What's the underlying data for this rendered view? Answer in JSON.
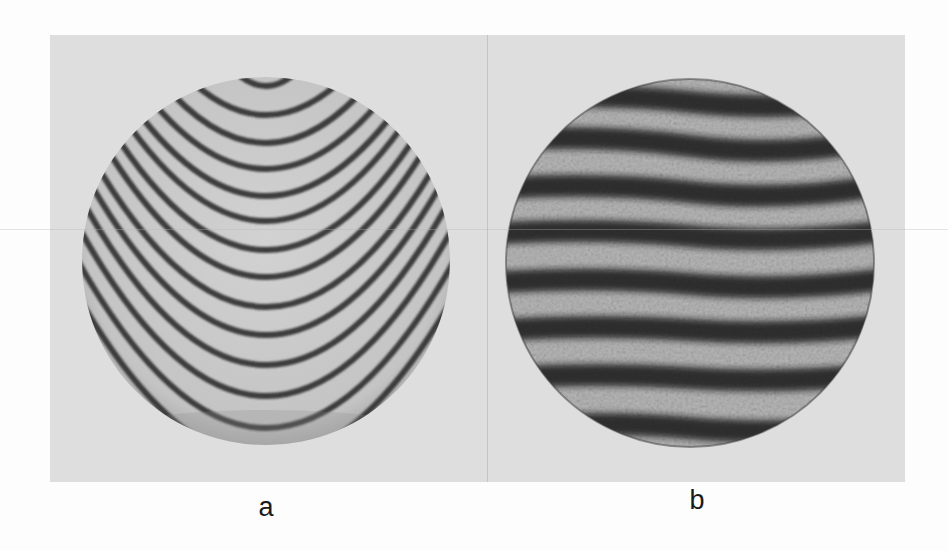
{
  "figure": {
    "panel_background": "#dedede",
    "subfigures": [
      {
        "id": "a",
        "label": "a",
        "description": "Interferogram with curved, parabolic (U-shaped) dark fringes on a light circular aperture",
        "aperture_fill": "#c9c9c9",
        "fringe_color": "#2a2a2a",
        "fringe_pattern": "parabolic",
        "fringe_count": 14
      },
      {
        "id": "b",
        "label": "b",
        "description": "Interferogram with roughly straight, horizontal, speckled dark fringes on a circular aperture",
        "aperture_fill": "#bdbdbd",
        "fringe_color": "#161616",
        "fringe_pattern": "horizontal",
        "fringe_count": 8
      }
    ]
  }
}
